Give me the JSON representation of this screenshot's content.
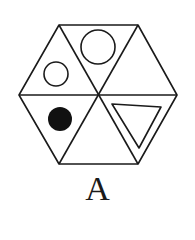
{
  "figure": {
    "label": "A",
    "stroke_color": "#1a1a1a",
    "background": "#ffffff",
    "hexagon": {
      "vertices": [
        [
          59,
          25
        ],
        [
          138,
          25
        ],
        [
          177,
          95
        ],
        [
          138,
          164
        ],
        [
          59,
          164
        ],
        [
          19,
          95
        ]
      ],
      "center": [
        99,
        95
      ]
    },
    "cells": [
      {
        "position": "top",
        "content": "large-open-circle"
      },
      {
        "position": "top-right",
        "content": "empty"
      },
      {
        "position": "bottom-right",
        "content": "open-triangle"
      },
      {
        "position": "bottom",
        "content": "empty"
      },
      {
        "position": "bottom-left",
        "content": "filled-circle"
      },
      {
        "position": "top-left",
        "content": "small-open-circle"
      }
    ]
  }
}
